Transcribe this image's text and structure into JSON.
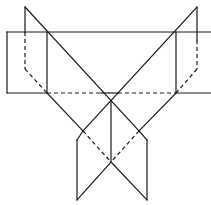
{
  "diagram": {
    "type": "geometry-net",
    "stroke_color": "#1a1a1a",
    "background": "#ffffff",
    "solid_segments": [
      {
        "id": "band-top",
        "x1": 7,
        "y1": 32,
        "x2": 211,
        "y2": 32
      },
      {
        "id": "band-left",
        "x1": 7,
        "y1": 32,
        "x2": 7,
        "y2": 93
      },
      {
        "id": "band-bottom-left",
        "x1": 7,
        "y1": 93,
        "x2": 47,
        "y2": 93
      },
      {
        "id": "band-bottom-right",
        "x1": 176,
        "y1": 93,
        "x2": 211,
        "y2": 93
      },
      {
        "id": "band-bottom-center",
        "x1": 101,
        "y1": 93,
        "x2": 118,
        "y2": 93
      },
      {
        "id": "inner-left-vertical",
        "x1": 47,
        "y1": 32,
        "x2": 47,
        "y2": 93
      },
      {
        "id": "inner-right-vertical",
        "x1": 176,
        "y1": 32,
        "x2": 176,
        "y2": 93
      },
      {
        "id": "left-flap-vertical",
        "x1": 25,
        "y1": 7,
        "x2": 25,
        "y2": 32
      },
      {
        "id": "right-flap-vertical",
        "x1": 197,
        "y1": 7,
        "x2": 197,
        "y2": 40
      },
      {
        "id": "diag-left-long",
        "x1": 25,
        "y1": 7,
        "x2": 139,
        "y2": 131
      },
      {
        "id": "diag-right-long",
        "x1": 197,
        "y1": 7,
        "x2": 83,
        "y2": 131
      },
      {
        "id": "diag-left-lower",
        "x1": 47,
        "y1": 93,
        "x2": 83,
        "y2": 131
      },
      {
        "id": "diag-right-lower",
        "x1": 176,
        "y1": 93,
        "x2": 139,
        "y2": 131
      },
      {
        "id": "center-vertical",
        "x1": 111,
        "y1": 101,
        "x2": 111,
        "y2": 162
      },
      {
        "id": "bottom-left-edge-top",
        "x1": 83,
        "y1": 131,
        "x2": 77,
        "y2": 140
      },
      {
        "id": "bottom-right-edge-top",
        "x1": 139,
        "y1": 131,
        "x2": 147,
        "y2": 140
      },
      {
        "id": "bottom-left-vertical",
        "x1": 77,
        "y1": 140,
        "x2": 77,
        "y2": 200
      },
      {
        "id": "bottom-right-vertical",
        "x1": 147,
        "y1": 140,
        "x2": 147,
        "y2": 200
      },
      {
        "id": "bottom-v-left",
        "x1": 111,
        "y1": 162,
        "x2": 77,
        "y2": 200
      },
      {
        "id": "bottom-v-right",
        "x1": 111,
        "y1": 162,
        "x2": 147,
        "y2": 200
      }
    ],
    "dashed_segments": [
      {
        "id": "band-bottom-dash-left",
        "x1": 47,
        "y1": 93,
        "x2": 101,
        "y2": 93
      },
      {
        "id": "band-bottom-dash-right",
        "x1": 118,
        "y1": 93,
        "x2": 176,
        "y2": 93
      },
      {
        "id": "left-flap-dash-vertical",
        "x1": 25,
        "y1": 32,
        "x2": 25,
        "y2": 69
      },
      {
        "id": "left-flap-dash-diag",
        "x1": 25,
        "y1": 69,
        "x2": 47,
        "y2": 93
      },
      {
        "id": "right-flap-dash-vertical",
        "x1": 197,
        "y1": 40,
        "x2": 197,
        "y2": 69
      },
      {
        "id": "right-flap-dash-diag",
        "x1": 197,
        "y1": 69,
        "x2": 176,
        "y2": 93
      },
      {
        "id": "bottom-dash-left",
        "x1": 83,
        "y1": 131,
        "x2": 111,
        "y2": 162
      },
      {
        "id": "bottom-dash-right",
        "x1": 139,
        "y1": 131,
        "x2": 111,
        "y2": 162
      }
    ]
  }
}
